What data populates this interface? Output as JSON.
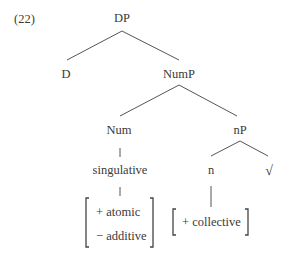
{
  "example_number": "(22)",
  "nodes": {
    "dp": "DP",
    "d": "D",
    "nump": "NumP",
    "num": "Num",
    "np": "nP",
    "n": "n",
    "root": "√",
    "singulative": "singulative"
  },
  "features": {
    "num_features": [
      "+ atomic",
      "− additive"
    ],
    "n_features": [
      "+ collective"
    ]
  },
  "colors": {
    "text": "#3a3a3a",
    "lines": "#555555",
    "background": "#ffffff"
  }
}
